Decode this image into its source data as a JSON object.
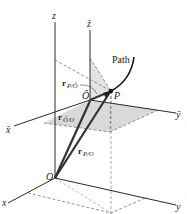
{
  "figure": {
    "type": "relative-position-diagram",
    "labels": {
      "z": "z",
      "z_bar": "z̄",
      "x": "x",
      "y": "y",
      "x_bar": "x̄",
      "y_bar": "ȳ",
      "origin": "O",
      "moving_origin": "Ô",
      "point": "P",
      "path": "Path"
    },
    "vectors": [
      {
        "id": "r_P_O",
        "symbol": "r",
        "subscript": "P/O"
      },
      {
        "id": "r_Ohat_O",
        "symbol": "r",
        "subscript": "Ô/O"
      },
      {
        "id": "r_P_Ohat",
        "symbol": "r",
        "subscript": "P/Ô"
      }
    ],
    "colors": {
      "line": "#2a2a2a",
      "plane_fill": "#d9d9d9",
      "dashed": "#666666"
    }
  }
}
